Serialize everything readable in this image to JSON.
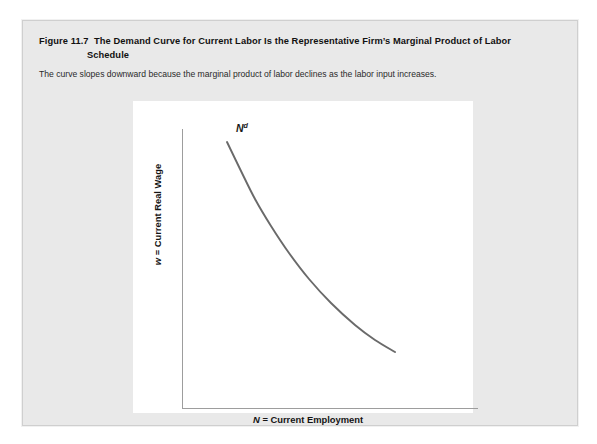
{
  "figure": {
    "number": "Figure 11.7",
    "title_line1": "The Demand Curve for Current Labor Is the Representative Firm’s Marginal Product of Labor",
    "title_line2": "Schedule",
    "subtitle": "The curve slopes downward because the marginal product of labor declines as the labor input increases."
  },
  "chart_data": {
    "type": "line",
    "title": "The Demand Curve for Current Labor Is the Representative Firm’s Marginal Product of Labor Schedule",
    "xlabel_var": "N",
    "xlabel_rest": " = Current Employment",
    "xlabel": "N = Current Employment",
    "ylabel_var": "w",
    "ylabel_rest": " = Current Real Wage",
    "ylabel": "w = Current Real Wage",
    "grid": false,
    "legend": "none",
    "axis_ticks": "none",
    "xlim": [
      0,
      1
    ],
    "ylim": [
      0,
      1
    ],
    "series": [
      {
        "name": "Nd",
        "label_var": "N",
        "label_sup": "d",
        "color": "#6a6a6a",
        "line_width": 1.9,
        "annotation": "labor demand curve, convex decreasing",
        "x": [
          0.0,
          0.08,
          0.17,
          0.26,
          0.35,
          0.45,
          0.55,
          0.66,
          0.78,
          0.91,
          1.0
        ],
        "y": [
          1.0,
          0.84,
          0.7,
          0.58,
          0.48,
          0.4,
          0.33,
          0.27,
          0.22,
          0.18,
          0.16
        ],
        "path_points_px": [
          [
            204,
            121
          ],
          [
            218,
            150
          ],
          [
            232,
            178
          ],
          [
            248,
            205
          ],
          [
            266,
            232
          ],
          [
            286,
            258
          ],
          [
            308,
            282
          ],
          [
            332,
            304
          ],
          [
            352,
            319
          ],
          [
            372,
            331
          ]
        ]
      }
    ]
  },
  "colors": {
    "card_background": "#e9e9e9",
    "panel_background": "#ffffff",
    "axis": "#9d9d9d",
    "curve": "#6a6a6a",
    "text": "#1b1b1b"
  }
}
